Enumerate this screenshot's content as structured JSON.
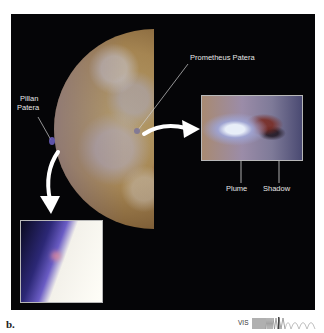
{
  "figure": {
    "label": "b.",
    "labels": {
      "prometheus": "Prometheus Patera",
      "pillan_line1": "Pillan",
      "pillan_line2": "Patera",
      "plume": "Plume",
      "shadow": "Shadow"
    },
    "spectrum": {
      "label": "VIS",
      "icon": "visible-spectrum-wave-icon"
    },
    "colors": {
      "panel_bg": "#050507",
      "label_text": "#e6e6e6",
      "page_bg": "#ffffff"
    }
  }
}
